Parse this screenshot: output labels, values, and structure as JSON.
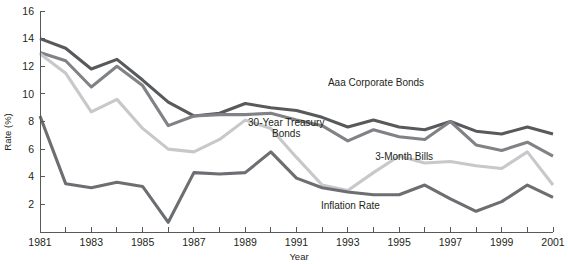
{
  "chart_data": {
    "type": "line",
    "title": "",
    "xlabel": "Year",
    "ylabel": "Rate (%)",
    "xlim": [
      1981,
      2001
    ],
    "ylim": [
      0,
      16
    ],
    "grid": false,
    "legend_position": "inline-annotations",
    "x": [
      1981,
      1982,
      1983,
      1984,
      1985,
      1986,
      1987,
      1988,
      1989,
      1990,
      1991,
      1992,
      1993,
      1994,
      1995,
      1996,
      1997,
      1998,
      1999,
      2000,
      2001
    ],
    "x_tick_labels": [
      "1981",
      "1983",
      "1985",
      "1987",
      "1989",
      "1991",
      "1993",
      "1995",
      "1997",
      "1999",
      "2001"
    ],
    "y_tick_labels": [
      "2",
      "4",
      "6",
      "8",
      "10",
      "12",
      "14",
      "16"
    ],
    "y_ticks": [
      2,
      4,
      6,
      8,
      10,
      12,
      14,
      16
    ],
    "series": [
      {
        "name": "Aaa Corporate Bonds",
        "color": "#58595b",
        "label_x": 1994.1,
        "label_y": 10.6,
        "values": [
          14.0,
          13.3,
          11.8,
          12.5,
          11.0,
          9.4,
          8.4,
          8.6,
          9.3,
          9.0,
          8.8,
          8.3,
          7.6,
          8.1,
          7.6,
          7.4,
          8.0,
          7.3,
          7.1,
          7.6,
          7.1
        ]
      },
      {
        "name": "30-Year Treasury Bonds",
        "color": "#808285",
        "label_x": 1990.6,
        "label_y": 7.7,
        "values": [
          13.0,
          12.4,
          10.5,
          12.0,
          10.6,
          7.7,
          8.4,
          8.5,
          8.5,
          8.6,
          8.1,
          7.7,
          6.6,
          7.4,
          6.9,
          6.7,
          8.0,
          6.3,
          5.9,
          6.5,
          5.5
        ]
      },
      {
        "name": "3-Month Bills",
        "color": "#c7c8ca",
        "label_x": 1995.2,
        "label_y": 5.2,
        "values": [
          12.9,
          11.5,
          8.7,
          9.6,
          7.5,
          6.0,
          5.8,
          6.7,
          8.1,
          7.5,
          5.4,
          3.4,
          3.0,
          4.3,
          5.5,
          5.0,
          5.1,
          4.8,
          4.6,
          5.8,
          3.4
        ]
      },
      {
        "name": "Inflation Rate",
        "color": "#6d6e71",
        "label_x": 1993.1,
        "label_y": 1.7,
        "values": [
          8.4,
          3.5,
          3.2,
          3.6,
          3.3,
          0.7,
          4.3,
          4.2,
          4.3,
          5.8,
          3.9,
          3.2,
          2.9,
          2.7,
          2.7,
          3.4,
          2.4,
          1.5,
          2.2,
          3.4,
          2.5
        ]
      }
    ]
  },
  "axes": {
    "y_axis_title": "Rate (%)",
    "x_axis_title": "Year"
  }
}
